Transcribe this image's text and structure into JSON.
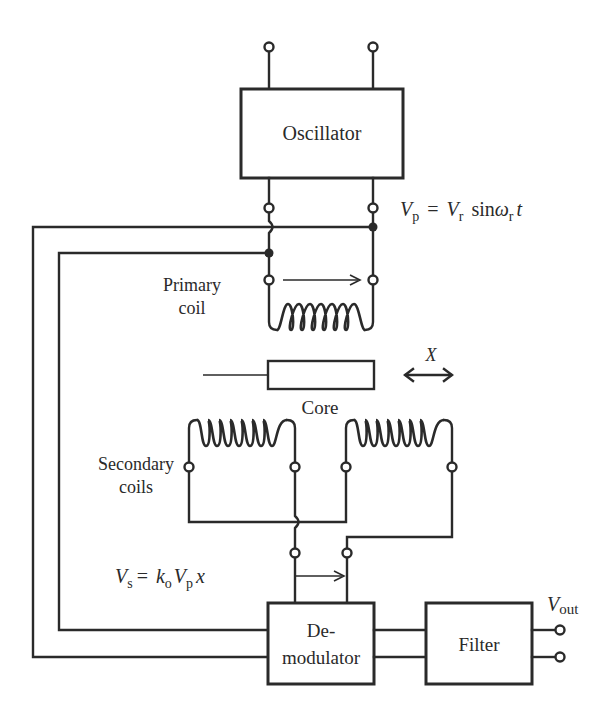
{
  "diagram": {
    "blocks": {
      "oscillator": "Oscillator",
      "demodulator_line1": "De-",
      "demodulator_line2": "modulator",
      "filter": "Filter"
    },
    "labels": {
      "primary_line1": "Primary",
      "primary_line2": "coil",
      "core": "Core",
      "displacement": "X",
      "secondary_line1": "Secondary",
      "secondary_line2": "coils"
    },
    "equations": {
      "vp": {
        "lhs": "V",
        "lhs_sub": "p",
        "eq": "=",
        "v": "V",
        "v_sub": "r",
        "fn": "sin",
        "omega": "ω",
        "omega_sub": "r",
        "t": "t"
      },
      "vs": {
        "lhs": "V",
        "lhs_sub": "s",
        "eq": "=",
        "k": "k",
        "k_sub": "o",
        "v": "V",
        "v_sub": "p",
        "x": "x"
      },
      "vout": {
        "v": "V",
        "sub": "out"
      }
    },
    "components": {
      "primary_coil_turns": 7,
      "secondary_coil_turns": 7,
      "secondary_coil_count": 2
    },
    "colors": {
      "line": "#2a2a2a",
      "background": "#ffffff"
    }
  }
}
